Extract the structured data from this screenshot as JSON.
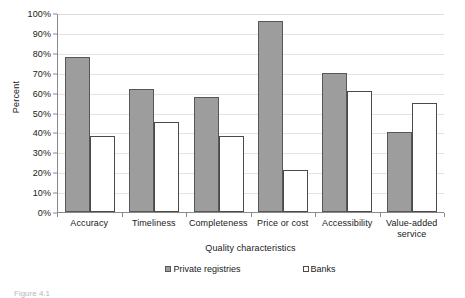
{
  "chart_data": {
    "type": "bar",
    "title": "",
    "xlabel": "Quality characteristics",
    "ylabel": "Percent",
    "categories": [
      "Accuracy",
      "Timeliness",
      "Completeness",
      "Price or cost",
      "Accessibility",
      "Value-added service"
    ],
    "series": [
      {
        "name": "Private registries",
        "values": [
          78,
          62,
          58,
          96,
          70,
          40
        ],
        "color": "#9d9d9d"
      },
      {
        "name": "Banks",
        "values": [
          38,
          45,
          38,
          21,
          61,
          55
        ],
        "color": "#ffffff"
      }
    ],
    "ylim": [
      0,
      100
    ],
    "ytick_labels": [
      "100%",
      "90%",
      "80%",
      "70%",
      "60%",
      "50%",
      "40%",
      "30%",
      "20%",
      "10%",
      "0%"
    ],
    "ytick_values": [
      100,
      90,
      80,
      70,
      60,
      50,
      40,
      30,
      20,
      10,
      0
    ],
    "grid": true,
    "legend_position": "bottom"
  },
  "axis": {
    "y_title": "Percent",
    "x_title": "Quality characteristics"
  },
  "legend": {
    "entries": [
      {
        "label": "Private registries",
        "marker": "filled-square-icon"
      },
      {
        "label": "Banks",
        "marker": "empty-square-icon"
      }
    ]
  },
  "caption": {
    "text": "Figure 4.1"
  }
}
